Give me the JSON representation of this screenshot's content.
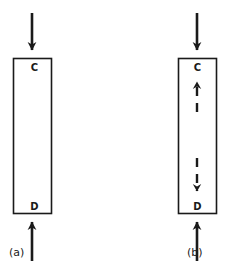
{
  "figure": {
    "background_color": "#ffffff",
    "stroke_color": "#1a1a1a",
    "panels": [
      {
        "id": "a",
        "caption": "(a)",
        "vessel": {
          "label_top": "C",
          "label_bottom": "D",
          "x": 13,
          "y": 58,
          "width": 39,
          "height": 156
        },
        "inflow_arrow": {
          "name": "top-inflow-arrow",
          "direction": "down",
          "style": "solid",
          "x": 32,
          "y_start": 13,
          "y_end": 57
        },
        "outflow_arrow": {
          "name": "bottom-inflow-arrow",
          "direction": "up",
          "style": "solid",
          "x": 32,
          "y_start": 261,
          "y_end": 215
        },
        "internal_arrows": []
      },
      {
        "id": "b",
        "caption": "(b)",
        "vessel": {
          "label_top": "C",
          "label_bottom": "D",
          "x": 178,
          "y": 58,
          "width": 39,
          "height": 156
        },
        "inflow_arrow": {
          "name": "top-inflow-arrow",
          "direction": "down",
          "style": "solid",
          "x": 197,
          "y_start": 13,
          "y_end": 57
        },
        "outflow_arrow": {
          "name": "bottom-inflow-arrow",
          "direction": "up",
          "style": "solid",
          "x": 197,
          "y_start": 261,
          "y_end": 215
        },
        "internal_arrows": [
          {
            "name": "upward-dashed-arrow",
            "direction": "up",
            "style": "dashed",
            "x": 197,
            "y_start": 112,
            "y_end": 75
          },
          {
            "name": "downward-dashed-arrow",
            "direction": "down",
            "style": "dashed",
            "x": 197,
            "y_start": 158,
            "y_end": 198
          }
        ]
      }
    ]
  },
  "labels": {
    "c": "C",
    "d": "D",
    "caption_a": "(a)",
    "caption_b": "(b)"
  }
}
